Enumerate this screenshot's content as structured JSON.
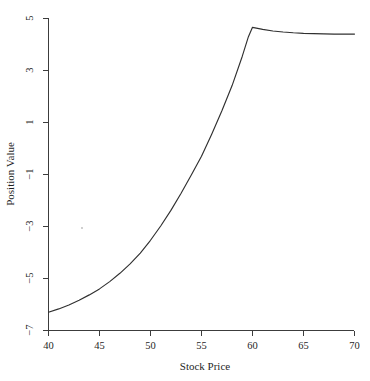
{
  "chart_data": {
    "type": "line",
    "title": "",
    "xlabel": "Stock Price",
    "ylabel": "Position Value",
    "xlim": [
      40,
      70
    ],
    "ylim": [
      -7,
      5
    ],
    "xticks": [
      40,
      45,
      50,
      55,
      60,
      65,
      70
    ],
    "xticklabels": [
      "40",
      "45",
      "50",
      "55",
      "60",
      "65",
      "70"
    ],
    "yticks": [
      5,
      3,
      1,
      -1,
      -3,
      -5,
      -7
    ],
    "yticklabels": [
      "5",
      "3",
      "1",
      "−1",
      "−3",
      "−5",
      "−7"
    ],
    "grid": false,
    "legend": null,
    "line_color": "#303030",
    "axis_color": "#3c3c3c",
    "background": "#ffffff",
    "series": [
      {
        "name": "Position Value",
        "x": [
          40,
          41,
          42,
          43,
          44,
          45,
          46,
          47,
          48,
          49,
          50,
          51,
          52,
          53,
          54,
          55,
          56,
          57,
          58,
          59,
          59.6,
          60,
          61,
          62,
          63,
          64,
          65,
          66,
          67,
          68,
          69,
          70
        ],
        "y": [
          -6.3,
          -6.17,
          -6.02,
          -5.84,
          -5.63,
          -5.4,
          -5.12,
          -4.8,
          -4.44,
          -4.02,
          -3.53,
          -2.98,
          -2.38,
          -1.72,
          -1.02,
          -0.3,
          0.55,
          1.45,
          2.42,
          3.55,
          4.3,
          4.66,
          4.58,
          4.52,
          4.48,
          4.45,
          4.43,
          4.42,
          4.41,
          4.4,
          4.4,
          4.4
        ]
      }
    ]
  },
  "axes": {
    "x_axis_label": "Stock Price",
    "y_axis_label": "Position Value"
  }
}
